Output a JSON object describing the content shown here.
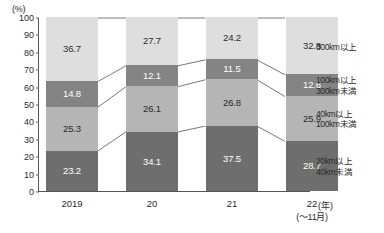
{
  "chart_data": {
    "type": "bar",
    "subtype": "stacked-100-percent",
    "title": "",
    "xlabel": "(年)",
    "ylabel": "(%)",
    "ylim": [
      0,
      100
    ],
    "ytick_step": 10,
    "yticks": [
      "100",
      "90",
      "80",
      "70",
      "60",
      "50",
      "40",
      "30",
      "20",
      "10",
      "0"
    ],
    "grid": false,
    "legend_position": "right",
    "categories": [
      "2019",
      "20",
      "21",
      "22"
    ],
    "category_sublabels": [
      "",
      "",
      "",
      "(～11月)"
    ],
    "series": [
      {
        "name": "20km以上\n40km未満",
        "name_line1": "20km以上",
        "name_line2": "40km未満",
        "color": "#6e6e6e",
        "label_color": "#ffffff",
        "values": [
          23.2,
          34.1,
          37.5,
          28.7
        ]
      },
      {
        "name": "40km以上\n100km未満",
        "name_line1": "40km以上",
        "name_line2": "100km未満",
        "color": "#b5b5b5",
        "label_color": "#2b2b2b",
        "values": [
          25.3,
          26.1,
          26.8,
          25.9
        ]
      },
      {
        "name": "100km以上\n300km未満",
        "name_line1": "100km以上",
        "name_line2": "300km未満",
        "color": "#848484",
        "label_color": "#ffffff",
        "values": [
          14.8,
          12.1,
          11.5,
          12.6
        ]
      },
      {
        "name": "300km以上",
        "name_line1": "300km以上",
        "name_line2": "",
        "color": "#dedede",
        "label_color": "#2b2b2b",
        "values": [
          36.7,
          27.7,
          24.2,
          32.8
        ]
      }
    ]
  },
  "axis": {
    "unit_top": "(%)",
    "unit_right": "(年)"
  }
}
